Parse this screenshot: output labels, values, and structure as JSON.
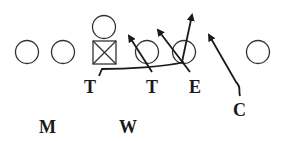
{
  "diagram": {
    "type": "football-play",
    "stroke_color": "#1a1a1a",
    "offense": [
      {
        "role": "player",
        "shape": "circle",
        "x": 27,
        "y": 52
      },
      {
        "role": "player",
        "shape": "circle",
        "x": 63,
        "y": 52
      },
      {
        "role": "center",
        "shape": "square-x",
        "x": 104,
        "y": 52
      },
      {
        "role": "player",
        "shape": "circle",
        "x": 104,
        "y": 27
      },
      {
        "role": "player",
        "shape": "circle",
        "x": 147,
        "y": 52
      },
      {
        "role": "player",
        "shape": "circle",
        "x": 184,
        "y": 52
      },
      {
        "role": "player",
        "shape": "circle",
        "x": 258,
        "y": 52
      }
    ],
    "defense_labels": [
      {
        "text": "T",
        "x": 93,
        "y": 93
      },
      {
        "text": "T",
        "x": 153,
        "y": 93
      },
      {
        "text": "E",
        "x": 197,
        "y": 93
      },
      {
        "text": "C",
        "x": 240,
        "y": 116
      },
      {
        "text": "M",
        "x": 48,
        "y": 133
      },
      {
        "text": "W",
        "x": 129,
        "y": 133
      }
    ]
  }
}
